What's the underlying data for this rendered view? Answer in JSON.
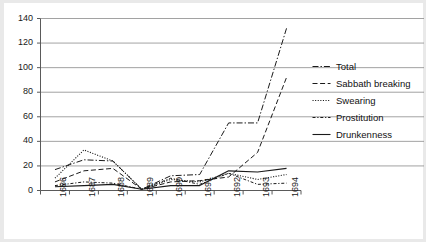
{
  "chart_data": {
    "type": "line",
    "title": "",
    "subtitle": "",
    "xlabel": "",
    "ylabel": "",
    "categories": [
      "1686",
      "1687",
      "1688",
      "1689",
      "1690",
      "1691",
      "1692",
      "1693",
      "1694"
    ],
    "ylim": [
      0,
      140
    ],
    "ytick_values": [
      0,
      20,
      40,
      60,
      80,
      100,
      120,
      140
    ],
    "ytick_labels": [
      "0",
      "20",
      "40",
      "60",
      "80",
      "100",
      "120",
      "140"
    ],
    "grid": "horizontal",
    "legend_position": "right",
    "series": [
      {
        "name": "Total",
        "style": "dash-dot",
        "values": [
          17,
          25,
          24,
          1,
          12,
          13,
          55,
          55,
          132
        ]
      },
      {
        "name": "Sabbath breaking",
        "style": "dashed",
        "values": [
          7,
          16,
          18,
          1,
          7,
          8,
          11,
          31,
          92
        ]
      },
      {
        "name": "Swearing",
        "style": "dotted",
        "values": [
          10,
          33,
          24,
          1,
          9,
          7,
          14,
          9,
          13
        ]
      },
      {
        "name": "Prostitution",
        "style": "dash-dot-short",
        "values": [
          4,
          7,
          6,
          1,
          10,
          5,
          14,
          5,
          6
        ]
      },
      {
        "name": "Drunkenness",
        "style": "solid",
        "values": [
          3,
          4,
          5,
          1,
          4,
          4,
          16,
          15,
          18
        ]
      }
    ]
  },
  "axes": {
    "y_axis_name": "y-axis",
    "x_axis_name": "x-axis"
  }
}
